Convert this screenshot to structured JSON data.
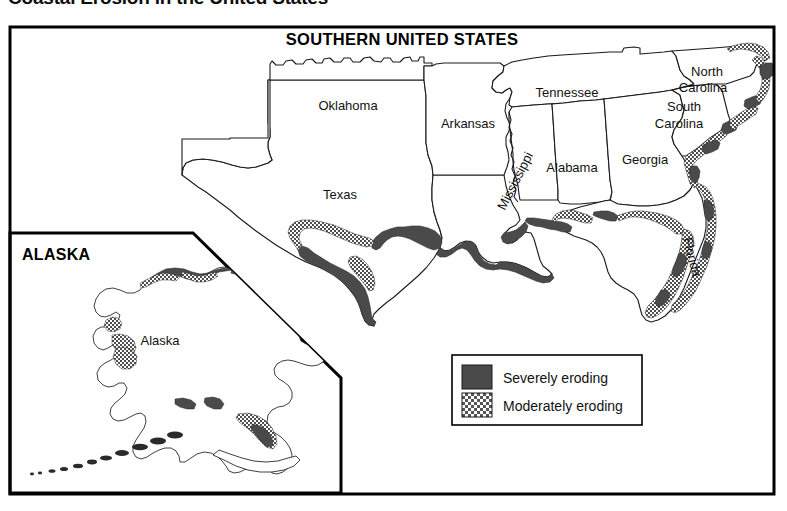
{
  "page": {
    "title": "Coastal Erosion in the United States"
  },
  "map": {
    "title": "SOUTHERN UNITED STATES",
    "state_labels": [
      {
        "name": "Oklahoma",
        "x": 348,
        "y": 110,
        "rotate": 0,
        "size": 13
      },
      {
        "name": "Texas",
        "x": 340,
        "y": 198,
        "rotate": 0,
        "size": 13
      },
      {
        "name": "Arkansas",
        "x": 465,
        "y": 126,
        "rotate": 0,
        "size": 13
      },
      {
        "name": "Tennessee",
        "x": 568,
        "y": 97,
        "rotate": 0,
        "size": 13
      },
      {
        "name": "Mississippi",
        "x": 519,
        "y": 184,
        "rotate": -62,
        "size": 12.5
      },
      {
        "name": "Alabama",
        "x": 568,
        "y": 170,
        "rotate": 0,
        "size": 13
      },
      {
        "name": "Georgia",
        "x": 640,
        "y": 163,
        "rotate": 0,
        "size": 13
      },
      {
        "name": "North",
        "x": 704,
        "y": 74,
        "rotate": 0,
        "size": 13
      },
      {
        "name": "Carolina",
        "x": 699,
        "y": 90,
        "rotate": 0,
        "size": 13
      },
      {
        "name": "South",
        "x": 680,
        "y": 110,
        "rotate": 0,
        "size": 13
      },
      {
        "name": "Carolina",
        "x": 673,
        "y": 126,
        "rotate": 0,
        "size": 13
      },
      {
        "name": "Florida",
        "x": 690,
        "y": 258,
        "rotate": 75,
        "size": 13
      }
    ]
  },
  "inset": {
    "title": "ALASKA",
    "state_label": "Alaska"
  },
  "legend": {
    "items": [
      {
        "label": "Severely eroding",
        "swatch": "solid",
        "color": "#4a4a4a"
      },
      {
        "label": "Moderately eroding",
        "swatch": "hatch",
        "color": "#6e6e6e"
      }
    ]
  },
  "colors": {
    "severe": "#4a4a4a",
    "moderate_stroke": "#555555",
    "outline": "#1a1a1a",
    "frame": "#000000",
    "background": "#ffffff"
  }
}
